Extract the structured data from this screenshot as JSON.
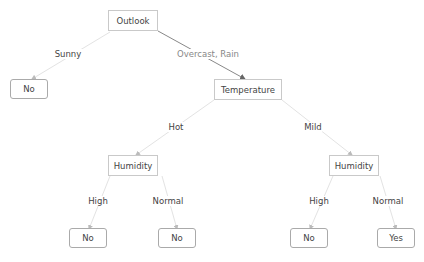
{
  "diagram": {
    "type": "decision-tree",
    "nodes": {
      "outlook": "Outlook",
      "leaf_sunny": "No",
      "temperature": "Temperature",
      "humidity_hot": "Humidity",
      "humidity_mild": "Humidity",
      "leaf_hot_high": "No",
      "leaf_hot_normal": "No",
      "leaf_mild_high": "No",
      "leaf_mild_normal": "Yes"
    },
    "edges": {
      "sunny": "Sunny",
      "overcast_rain": "Overcast, Rain",
      "hot": "Hot",
      "mild": "Mild",
      "hot_high": "High",
      "hot_normal": "Normal",
      "mild_high": "High",
      "mild_normal": "Normal"
    },
    "colors": {
      "edge": "#dddddd",
      "highlight_edge": "#888888",
      "node_border": "#c9c9c9",
      "text": "#444444"
    }
  }
}
